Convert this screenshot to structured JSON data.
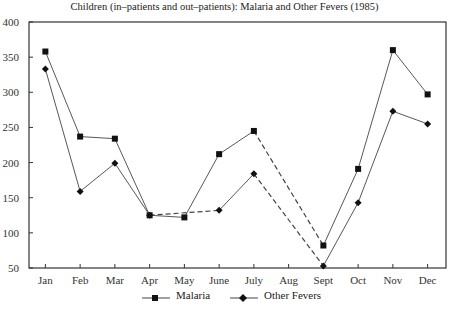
{
  "chart_data": {
    "type": "line",
    "title": "Children (in–patients and out–patients):  Malaria and Other Fevers (1985)",
    "xlabel": "",
    "ylabel": "",
    "ylim": [
      50,
      400
    ],
    "yticks": [
      50,
      100,
      150,
      200,
      250,
      300,
      350,
      400
    ],
    "categories": [
      "Jan",
      "Feb",
      "Mar",
      "Apr",
      "May",
      "June",
      "July",
      "Aug",
      "Sept",
      "Oct",
      "Nov",
      "Dec"
    ],
    "series": [
      {
        "name": "Malaria",
        "marker": "square",
        "values": [
          358,
          237,
          234,
          125,
          122,
          212,
          245,
          null,
          82,
          191,
          360,
          297
        ]
      },
      {
        "name": "Other Fevers",
        "marker": "diamond",
        "values": [
          333,
          159,
          199,
          125,
          null,
          132,
          184,
          null,
          53,
          143,
          273,
          255
        ]
      }
    ],
    "annotations": [
      "Dashed segments indicate gaps (missing data): Other Fevers Apr–June, both series July–Sept"
    ],
    "grid": false,
    "legend_position": "bottom"
  },
  "legend": {
    "malaria": "Malaria",
    "other": "Other Fevers"
  }
}
